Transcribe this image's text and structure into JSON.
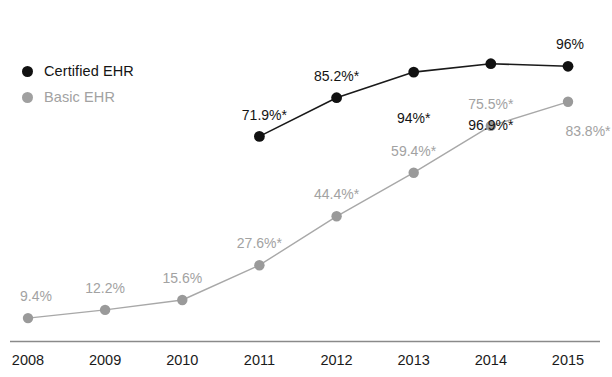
{
  "chart_data": {
    "type": "line",
    "title": "",
    "subtitle": "",
    "xlabel": "",
    "ylabel": "",
    "categories": [
      "2008",
      "2009",
      "2010",
      "2011",
      "2012",
      "2013",
      "2014",
      "2015"
    ],
    "ylim": [
      0,
      100
    ],
    "grid": false,
    "legend_position": "upper-left",
    "annotation_note": "* indicates significant difference from previous year",
    "series": [
      {
        "name": "Certified EHR",
        "color": "#111111",
        "x": [
          "2011",
          "2012",
          "2013",
          "2014",
          "2015"
        ],
        "values": [
          71.9,
          85.2,
          94,
          96.9,
          96
        ],
        "labels": [
          "71.9%*",
          "85.2%*",
          "94%*",
          "96.9%*",
          "96%"
        ],
        "label_positions": [
          "below-left",
          "above",
          "below",
          "below",
          "above"
        ]
      },
      {
        "name": "Basic EHR",
        "color": "#a0a0a0",
        "x": [
          "2008",
          "2009",
          "2010",
          "2011",
          "2012",
          "2013",
          "2014",
          "2015"
        ],
        "values": [
          9.4,
          12.2,
          15.6,
          27.6,
          44.4,
          59.4,
          75.5,
          83.8
        ],
        "labels": [
          "9.4%",
          "12.2%",
          "15.6%",
          "27.6%*",
          "44.4%*",
          "59.4%*",
          "75.5%*",
          "83.8%*"
        ],
        "label_positions": [
          "above-left",
          "above",
          "above",
          "above",
          "above",
          "above",
          "above",
          "right-below"
        ]
      }
    ]
  },
  "legend": {
    "items": [
      {
        "label": "Certified EHR",
        "color": "#111111",
        "key": "certified"
      },
      {
        "label": "Basic EHR",
        "color": "#a0a0a0",
        "key": "basic"
      }
    ]
  },
  "axis": {
    "tick_labels": [
      "2008",
      "2009",
      "2010",
      "2011",
      "2012",
      "2013",
      "2014",
      "2015"
    ],
    "line_color": "#8a8a8a"
  },
  "colors": {
    "certified": "#111111",
    "basic": "#a0a0a0",
    "axis": "#8a8a8a",
    "background": "#ffffff"
  }
}
